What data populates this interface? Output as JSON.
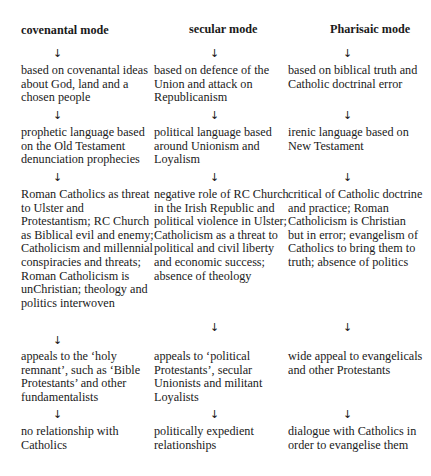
{
  "columns": [
    {
      "heading": "covenantal mode",
      "steps": [
        "based on covenantal ideas about God, land and a chosen people",
        "prophetic language based on the Old Testament denunciation prophecies",
        "Roman Catholics as threat to Ulster and Protestantism; RC Church as Biblical evil and enemy; Catholicism and millennial conspiracies and threats; Roman Catholicism is unChristian; theology and politics interwoven",
        "appeals to the ‘holy remnant’, such as ‘Bible Protestants’ and other fundamentalists",
        "no relationship with Catholics"
      ]
    },
    {
      "heading": "secular mode",
      "steps": [
        "based on defence of the Union and attack on Republicanism",
        "political language based around Unionism and Loyalism",
        "negative role of RC Church in the Irish Republic and political violence in Ulster; Catholicism as a threat to political and civil liberty and economic success; absence of theology",
        "appeals to ‘political Protestants’, secular Unionists and militant Loyalists",
        "politically expedient relationships"
      ]
    },
    {
      "heading": "Pharisaic mode",
      "steps": [
        "based on biblical truth and Catholic doctrinal error",
        "irenic language based on New Testament",
        "critical of Catholic doctrine and practice; Roman Catholicism is Christian but in error; evangelism of Catholics to bring them to truth; absence of politics",
        "wide appeal to evangelicals and other Protestants",
        "dialogue with Catholics in order to evangelise them"
      ]
    }
  ],
  "arrow_glyph": "↓"
}
